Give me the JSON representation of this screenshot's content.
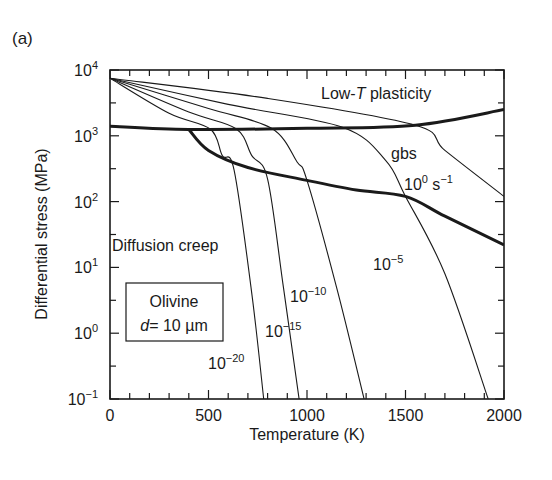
{
  "panel_label": "(a)",
  "chart_data": {
    "type": "line",
    "title": "",
    "xlabel": "Temperature (K)",
    "ylabel": "Differential stress (MPa)",
    "xlim": [
      0,
      2000
    ],
    "ylim_log10": [
      -1,
      4
    ],
    "yscale": "log",
    "x_ticks": [
      "0",
      "500",
      "1000",
      "1500",
      "2000"
    ],
    "y_ticks": [
      {
        "base": "10",
        "exp": "4",
        "value": 10000
      },
      {
        "base": "10",
        "exp": "3",
        "value": 1000
      },
      {
        "base": "10",
        "exp": "2",
        "value": 100
      },
      {
        "base": "10",
        "exp": "1",
        "value": 10
      },
      {
        "base": "10",
        "exp": "0",
        "value": 1
      },
      {
        "base": "10",
        "exp": "−1",
        "value": 0.1
      }
    ],
    "grid": false,
    "regions": {
      "low_t_plasticity": "Low-T plasticity",
      "gbs": "gbs",
      "diffusion_creep": "Diffusion creep"
    },
    "inset_box": {
      "line1": "Olivine",
      "line2_var": "d",
      "line2_rest": "= 10 µm"
    },
    "boundaries": [
      {
        "name": "low-T plasticity / gbs boundary",
        "points": [
          [
            0,
            1400
          ],
          [
            400,
            1250
          ],
          [
            1000,
            1300
          ],
          [
            1550,
            1450
          ],
          [
            2000,
            2500
          ]
        ]
      },
      {
        "name": "gbs / diffusion creep boundary",
        "points": [
          [
            400,
            1250
          ],
          [
            500,
            600
          ],
          [
            700,
            330
          ],
          [
            1000,
            210
          ],
          [
            1250,
            150
          ],
          [
            1500,
            120
          ],
          [
            1700,
            60
          ],
          [
            2000,
            22
          ]
        ]
      }
    ],
    "series": [
      {
        "name": "1e0 s^-1",
        "label_base": "10",
        "label_exp": "0",
        "label_unit": " s",
        "label_unit_exp": "−1",
        "points": [
          [
            0,
            7500
          ],
          [
            800,
            3700
          ],
          [
            1550,
            1450
          ],
          [
            1700,
            600
          ],
          [
            2000,
            120
          ]
        ]
      },
      {
        "name": "1e-5 s^-1",
        "label_base": "10",
        "label_exp": "−5",
        "points": [
          [
            0,
            7500
          ],
          [
            600,
            3000
          ],
          [
            1180,
            1350
          ],
          [
            1400,
            420
          ],
          [
            1500,
            120
          ],
          [
            1700,
            8
          ],
          [
            1920,
            0.1
          ]
        ]
      },
      {
        "name": "1e-10 s^-1",
        "label_base": "10",
        "label_exp": "−10",
        "points": [
          [
            0,
            7500
          ],
          [
            500,
            2600
          ],
          [
            820,
            1300
          ],
          [
            950,
            400
          ],
          [
            1000,
            210
          ],
          [
            1150,
            5
          ],
          [
            1290,
            0.1
          ]
        ]
      },
      {
        "name": "1e-15 s^-1",
        "label_base": "10",
        "label_exp": "−15",
        "points": [
          [
            0,
            7500
          ],
          [
            400,
            2300
          ],
          [
            640,
            1280
          ],
          [
            720,
            500
          ],
          [
            800,
            220
          ],
          [
            880,
            5
          ],
          [
            960,
            0.1
          ]
        ]
      },
      {
        "name": "1e-20 s^-1",
        "label_base": "10",
        "label_exp": "−20",
        "points": [
          [
            0,
            7500
          ],
          [
            300,
            2200
          ],
          [
            510,
            1260
          ],
          [
            570,
            500
          ],
          [
            630,
            300
          ],
          [
            720,
            4
          ],
          [
            780,
            0.1
          ]
        ]
      }
    ]
  }
}
